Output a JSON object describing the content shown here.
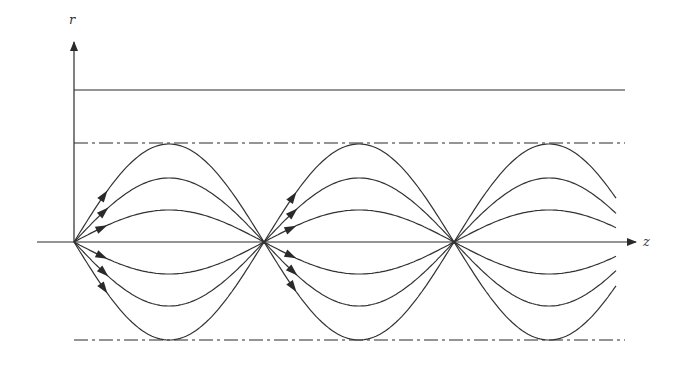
{
  "diagram": {
    "axes": {
      "vertical_label": "r",
      "horizontal_label": "z"
    },
    "origin": {
      "x": 74,
      "y": 242
    },
    "top_boundary_y": 90,
    "upper_envelope_y": 143,
    "lower_envelope_y": 340,
    "nodes_x": [
      74,
      263,
      455
    ],
    "half_period_px": 190,
    "ray_amplitudes_px": [
      98,
      64,
      32
    ],
    "right_end_x": 616,
    "line_color": "#2a2a2a",
    "arrows_at_nodes": [
      0,
      1
    ]
  }
}
